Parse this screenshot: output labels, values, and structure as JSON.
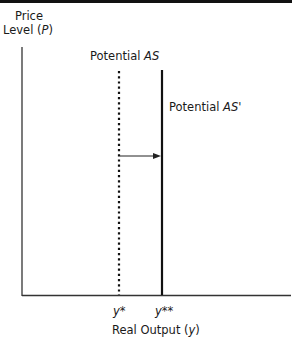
{
  "figure": {
    "type": "diagram",
    "y_axis_label_line1": "Price",
    "y_axis_label_line2_prefix": "Level (",
    "y_axis_label_var": "P",
    "y_axis_label_suffix": ")",
    "x_axis_label_prefix": "Real Output (",
    "x_axis_label_var": "y",
    "x_axis_label_suffix": ")",
    "curves": [
      {
        "name": "Potential AS",
        "label_prefix": "Potential ",
        "label_var": "AS",
        "label_suffix": "",
        "style": "dotted",
        "x_tick": "y*"
      },
      {
        "name": "Potential AS'",
        "label_prefix": "Potential ",
        "label_var": "AS",
        "label_suffix": "'",
        "style": "solid",
        "x_tick": "y**"
      }
    ],
    "tick_labels": {
      "y_star": "y*",
      "y_double_star": "y**"
    },
    "arrow": {
      "from": "Potential AS",
      "to": "Potential AS'",
      "direction": "right"
    }
  }
}
